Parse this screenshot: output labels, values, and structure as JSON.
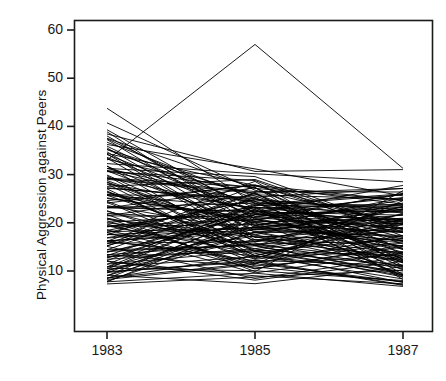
{
  "chart_data": {
    "type": "line",
    "title": "",
    "xlabel": "",
    "ylabel": "Physical Aggression against Peers",
    "x": [
      1983,
      1985,
      1987
    ],
    "xtick_labels": [
      "1983",
      "1985",
      "1987"
    ],
    "ytick_labels": [
      "10",
      "20",
      "30",
      "40",
      "50",
      "60"
    ],
    "ytick_values": [
      10,
      20,
      30,
      40,
      50,
      60
    ],
    "xlim": [
      1982.4,
      1987.6
    ],
    "ylim": [
      3.5,
      63
    ],
    "grid": false,
    "legend": null,
    "line_color": "#000000",
    "line_width": 0.9,
    "series": [
      {
        "name": "case-001",
        "values": [
          33.0,
          57.0,
          31.3
        ]
      },
      {
        "name": "case-002",
        "values": [
          44.0,
          24.0,
          18.0
        ]
      },
      {
        "name": "case-003",
        "values": [
          40.5,
          26.5,
          20.0
        ]
      },
      {
        "name": "case-004",
        "values": [
          39.5,
          22.0,
          16.5
        ]
      },
      {
        "name": "case-005",
        "values": [
          38.5,
          30.5,
          31.0
        ]
      },
      {
        "name": "case-006",
        "values": [
          38.0,
          20.5,
          14.5
        ]
      },
      {
        "name": "case-007",
        "values": [
          37.5,
          27.0,
          24.5
        ]
      },
      {
        "name": "case-008",
        "values": [
          37.0,
          19.0,
          22.5
        ]
      },
      {
        "name": "case-009",
        "values": [
          36.5,
          25.0,
          17.0
        ]
      },
      {
        "name": "case-010",
        "values": [
          36.0,
          31.0,
          25.5
        ]
      },
      {
        "name": "case-011",
        "values": [
          35.5,
          18.0,
          12.5
        ]
      },
      {
        "name": "case-012",
        "values": [
          35.0,
          23.5,
          26.0
        ]
      },
      {
        "name": "case-013",
        "values": [
          34.5,
          28.0,
          19.5
        ]
      },
      {
        "name": "case-014",
        "values": [
          34.0,
          16.5,
          13.0
        ]
      },
      {
        "name": "case-015",
        "values": [
          33.5,
          21.5,
          23.0
        ]
      },
      {
        "name": "case-016",
        "values": [
          33.0,
          26.0,
          15.5
        ]
      },
      {
        "name": "case-017",
        "values": [
          32.5,
          30.0,
          28.5
        ]
      },
      {
        "name": "case-018",
        "values": [
          32.0,
          14.0,
          11.0
        ]
      },
      {
        "name": "case-019",
        "values": [
          31.5,
          24.5,
          20.5
        ]
      },
      {
        "name": "case-020",
        "values": [
          31.0,
          19.5,
          25.0
        ]
      },
      {
        "name": "case-021",
        "values": [
          30.5,
          28.5,
          17.5
        ]
      },
      {
        "name": "case-022",
        "values": [
          30.0,
          13.0,
          21.0
        ]
      },
      {
        "name": "case-023",
        "values": [
          29.5,
          22.5,
          14.0
        ]
      },
      {
        "name": "case-024",
        "values": [
          29.0,
          26.5,
          26.5
        ]
      },
      {
        "name": "case-025",
        "values": [
          28.5,
          17.0,
          10.5
        ]
      },
      {
        "name": "case-026",
        "values": [
          28.0,
          23.0,
          24.0
        ]
      },
      {
        "name": "case-027",
        "values": [
          27.5,
          29.0,
          18.5
        ]
      },
      {
        "name": "case-028",
        "values": [
          27.0,
          12.5,
          22.0
        ]
      },
      {
        "name": "case-029",
        "values": [
          26.5,
          20.0,
          13.5
        ]
      },
      {
        "name": "case-030",
        "values": [
          26.0,
          25.5,
          27.0
        ]
      },
      {
        "name": "case-031",
        "values": [
          25.5,
          15.5,
          9.5
        ]
      },
      {
        "name": "case-032",
        "values": [
          25.0,
          21.0,
          19.0
        ]
      },
      {
        "name": "case-033",
        "values": [
          24.5,
          27.5,
          24.5
        ]
      },
      {
        "name": "case-034",
        "values": [
          24.0,
          11.5,
          16.0
        ]
      },
      {
        "name": "case-035",
        "values": [
          23.5,
          18.5,
          12.0
        ]
      },
      {
        "name": "case-036",
        "values": [
          23.0,
          24.0,
          23.5
        ]
      },
      {
        "name": "case-037",
        "values": [
          22.5,
          14.5,
          8.5
        ]
      },
      {
        "name": "case-038",
        "values": [
          22.0,
          20.5,
          20.0
        ]
      },
      {
        "name": "case-039",
        "values": [
          21.5,
          26.0,
          25.0
        ]
      },
      {
        "name": "case-040",
        "values": [
          21.0,
          10.5,
          15.0
        ]
      },
      {
        "name": "case-041",
        "values": [
          20.5,
          17.5,
          11.5
        ]
      },
      {
        "name": "case-042",
        "values": [
          20.0,
          22.0,
          22.5
        ]
      },
      {
        "name": "case-043",
        "values": [
          19.5,
          13.5,
          7.5
        ]
      },
      {
        "name": "case-044",
        "values": [
          19.0,
          19.5,
          18.0
        ]
      },
      {
        "name": "case-045",
        "values": [
          18.5,
          24.5,
          23.0
        ]
      },
      {
        "name": "case-046",
        "values": [
          18.0,
          9.5,
          14.0
        ]
      },
      {
        "name": "case-047",
        "values": [
          17.5,
          16.0,
          10.5
        ]
      },
      {
        "name": "case-048",
        "values": [
          17.0,
          21.5,
          21.0
        ]
      },
      {
        "name": "case-049",
        "values": [
          16.5,
          12.0,
          7.0
        ]
      },
      {
        "name": "case-050",
        "values": [
          16.0,
          18.5,
          17.0
        ]
      },
      {
        "name": "case-051",
        "values": [
          15.5,
          23.0,
          22.0
        ]
      },
      {
        "name": "case-052",
        "values": [
          15.0,
          8.5,
          13.0
        ]
      },
      {
        "name": "case-053",
        "values": [
          14.5,
          15.0,
          9.5
        ]
      },
      {
        "name": "case-054",
        "values": [
          14.0,
          20.0,
          20.5
        ]
      },
      {
        "name": "case-055",
        "values": [
          13.5,
          11.0,
          7.5
        ]
      },
      {
        "name": "case-056",
        "values": [
          13.0,
          17.5,
          16.5
        ]
      },
      {
        "name": "case-057",
        "values": [
          12.5,
          22.0,
          21.5
        ]
      },
      {
        "name": "case-058",
        "values": [
          12.0,
          8.0,
          12.0
        ]
      },
      {
        "name": "case-059",
        "values": [
          11.5,
          14.0,
          9.0
        ]
      },
      {
        "name": "case-060",
        "values": [
          11.0,
          19.0,
          19.5
        ]
      },
      {
        "name": "case-061",
        "values": [
          10.5,
          10.0,
          8.0
        ]
      },
      {
        "name": "case-062",
        "values": [
          10.0,
          16.5,
          15.5
        ]
      },
      {
        "name": "case-063",
        "values": [
          9.5,
          21.0,
          20.5
        ]
      },
      {
        "name": "case-064",
        "values": [
          9.0,
          7.5,
          11.0
        ]
      },
      {
        "name": "case-065",
        "values": [
          8.5,
          13.0,
          8.5
        ]
      },
      {
        "name": "case-066",
        "values": [
          8.0,
          18.0,
          18.5
        ]
      },
      {
        "name": "case-067",
        "values": [
          7.5,
          9.5,
          7.0
        ]
      },
      {
        "name": "case-068",
        "values": [
          34.0,
          22.0,
          27.5
        ]
      },
      {
        "name": "case-069",
        "values": [
          31.5,
          29.5,
          19.0
        ]
      },
      {
        "name": "case-070",
        "values": [
          29.0,
          17.5,
          24.0
        ]
      },
      {
        "name": "case-071",
        "values": [
          27.0,
          25.0,
          16.0
        ]
      },
      {
        "name": "case-072",
        "values": [
          25.0,
          20.5,
          26.0
        ]
      },
      {
        "name": "case-073",
        "values": [
          23.0,
          27.0,
          14.5
        ]
      },
      {
        "name": "case-074",
        "values": [
          21.0,
          15.5,
          23.5
        ]
      },
      {
        "name": "case-075",
        "values": [
          19.0,
          23.5,
          13.0
        ]
      },
      {
        "name": "case-076",
        "values": [
          17.0,
          19.0,
          21.5
        ]
      },
      {
        "name": "case-077",
        "values": [
          15.0,
          26.0,
          11.5
        ]
      },
      {
        "name": "case-078",
        "values": [
          13.0,
          14.5,
          19.5
        ]
      },
      {
        "name": "case-079",
        "values": [
          11.0,
          22.5,
          10.0
        ]
      },
      {
        "name": "case-080",
        "values": [
          9.0,
          18.0,
          17.5
        ]
      },
      {
        "name": "case-081",
        "values": [
          36.0,
          21.0,
          15.0
        ]
      },
      {
        "name": "case-082",
        "values": [
          33.5,
          16.0,
          23.0
        ]
      },
      {
        "name": "case-083",
        "values": [
          30.5,
          24.0,
          12.5
        ]
      },
      {
        "name": "case-084",
        "values": [
          28.0,
          12.5,
          20.0
        ]
      },
      {
        "name": "case-085",
        "values": [
          26.0,
          20.0,
          9.0
        ]
      },
      {
        "name": "case-086",
        "values": [
          24.0,
          28.0,
          18.0
        ]
      },
      {
        "name": "case-087",
        "values": [
          22.0,
          10.0,
          26.5
        ]
      },
      {
        "name": "case-088",
        "values": [
          20.0,
          17.0,
          14.0
        ]
      },
      {
        "name": "case-089",
        "values": [
          18.0,
          25.0,
          22.0
        ]
      },
      {
        "name": "case-090",
        "values": [
          16.0,
          13.0,
          10.0
        ]
      },
      {
        "name": "case-091",
        "values": [
          14.0,
          21.5,
          18.5
        ]
      },
      {
        "name": "case-092",
        "values": [
          12.0,
          9.0,
          7.5
        ]
      },
      {
        "name": "case-093",
        "values": [
          10.0,
          19.5,
          16.0
        ]
      },
      {
        "name": "case-094",
        "values": [
          8.0,
          11.5,
          24.5
        ]
      },
      {
        "name": "case-095",
        "values": [
          37.5,
          23.0,
          12.0
        ]
      },
      {
        "name": "case-096",
        "values": [
          32.0,
          18.5,
          20.5
        ]
      },
      {
        "name": "case-097",
        "values": [
          29.5,
          27.5,
          9.5
        ]
      },
      {
        "name": "case-098",
        "values": [
          26.5,
          14.0,
          17.0
        ]
      },
      {
        "name": "case-099",
        "values": [
          23.5,
          22.0,
          25.5
        ]
      },
      {
        "name": "case-100",
        "values": [
          20.5,
          11.0,
          13.5
        ]
      },
      {
        "name": "case-101",
        "values": [
          17.5,
          19.0,
          21.0
        ]
      },
      {
        "name": "case-102",
        "values": [
          15.5,
          26.5,
          8.0
        ]
      },
      {
        "name": "case-103",
        "values": [
          13.5,
          15.5,
          16.5
        ]
      },
      {
        "name": "case-104",
        "values": [
          11.5,
          23.5,
          23.5
        ]
      },
      {
        "name": "case-105",
        "values": [
          9.5,
          12.0,
          11.0
        ]
      },
      {
        "name": "case-106",
        "values": [
          7.8,
          20.0,
          18.0
        ]
      },
      {
        "name": "case-107",
        "values": [
          35.0,
          25.5,
          14.5
        ]
      },
      {
        "name": "case-108",
        "values": [
          30.0,
          16.5,
          22.0
        ]
      },
      {
        "name": "case-109",
        "values": [
          27.5,
          24.5,
          10.5
        ]
      },
      {
        "name": "case-110",
        "values": [
          24.5,
          13.5,
          19.0
        ]
      },
      {
        "name": "case-111",
        "values": [
          21.5,
          21.0,
          26.0
        ]
      },
      {
        "name": "case-112",
        "values": [
          18.5,
          10.5,
          15.5
        ]
      },
      {
        "name": "case-113",
        "values": [
          16.5,
          18.0,
          23.0
        ]
      },
      {
        "name": "case-114",
        "values": [
          14.5,
          25.5,
          12.5
        ]
      },
      {
        "name": "case-115",
        "values": [
          12.5,
          14.5,
          20.0
        ]
      },
      {
        "name": "case-116",
        "values": [
          10.5,
          22.5,
          9.0
        ]
      },
      {
        "name": "case-117",
        "values": [
          8.5,
          11.5,
          17.5
        ]
      },
      {
        "name": "case-118",
        "values": [
          39.0,
          19.5,
          25.0
        ]
      },
      {
        "name": "case-119",
        "values": [
          31.0,
          27.0,
          13.5
        ]
      },
      {
        "name": "case-120",
        "values": [
          28.5,
          15.0,
          21.0
        ]
      },
      {
        "name": "case-121",
        "values": [
          25.5,
          23.0,
          8.5
        ]
      },
      {
        "name": "case-122",
        "values": [
          22.5,
          12.5,
          16.0
        ]
      },
      {
        "name": "case-123",
        "values": [
          19.5,
          20.5,
          24.0
        ]
      },
      {
        "name": "case-124",
        "values": [
          17.5,
          28.5,
          11.0
        ]
      },
      {
        "name": "case-125",
        "values": [
          15.5,
          16.0,
          18.5
        ]
      },
      {
        "name": "case-126",
        "values": [
          13.0,
          24.0,
          26.0
        ]
      },
      {
        "name": "case-127",
        "values": [
          11.0,
          13.0,
          14.0
        ]
      },
      {
        "name": "case-128",
        "values": [
          9.0,
          21.5,
          22.5
        ]
      },
      {
        "name": "case-129",
        "values": [
          7.3,
          9.0,
          10.0
        ]
      },
      {
        "name": "case-130",
        "values": [
          34.5,
          17.0,
          19.0
        ]
      },
      {
        "name": "case-131",
        "values": [
          29.0,
          26.0,
          27.0
        ]
      },
      {
        "name": "case-132",
        "values": [
          26.5,
          14.5,
          13.0
        ]
      },
      {
        "name": "case-133",
        "values": [
          23.0,
          22.5,
          20.5
        ]
      },
      {
        "name": "case-134",
        "values": [
          20.0,
          11.5,
          8.0
        ]
      },
      {
        "name": "case-135",
        "values": [
          18.0,
          19.0,
          16.5
        ]
      },
      {
        "name": "case-136",
        "values": [
          16.0,
          27.5,
          24.0
        ]
      },
      {
        "name": "case-137",
        "values": [
          14.0,
          15.5,
          12.0
        ]
      },
      {
        "name": "case-138",
        "values": [
          12.0,
          23.5,
          19.5
        ]
      },
      {
        "name": "case-139",
        "values": [
          10.0,
          12.0,
          7.2
        ]
      },
      {
        "name": "case-140",
        "values": [
          8.2,
          20.5,
          15.0
        ]
      }
    ]
  },
  "axes": {
    "y_axis_title": "Physical Aggression against Peers",
    "y_ticks": [
      {
        "label": "60",
        "value": 60
      },
      {
        "label": "50",
        "value": 50
      },
      {
        "label": "40",
        "value": 40
      },
      {
        "label": "30",
        "value": 30
      },
      {
        "label": "20",
        "value": 20
      },
      {
        "label": "10",
        "value": 10
      }
    ],
    "x_ticks": [
      {
        "label": "1983",
        "value": 1983
      },
      {
        "label": "1985",
        "value": 1985
      },
      {
        "label": "1987",
        "value": 1987
      }
    ],
    "frame_color": "#1a1a1a"
  }
}
